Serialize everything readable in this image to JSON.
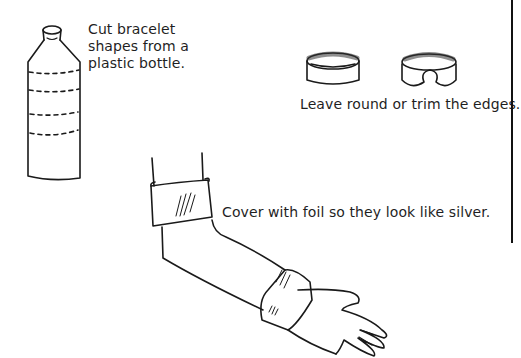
{
  "captions": {
    "bottle": [
      "Cut bracelet",
      "shapes from a",
      "plastic bottle."
    ],
    "trim": "Leave round or trim the edges.",
    "foil": "Cover with foil so they look like silver."
  },
  "illustrations": [
    "plastic-bottle",
    "round-bracelet",
    "open-bracelet",
    "arm-with-bracelets"
  ],
  "colors": {
    "ink": "#1a1a1a",
    "background": "#ffffff"
  }
}
